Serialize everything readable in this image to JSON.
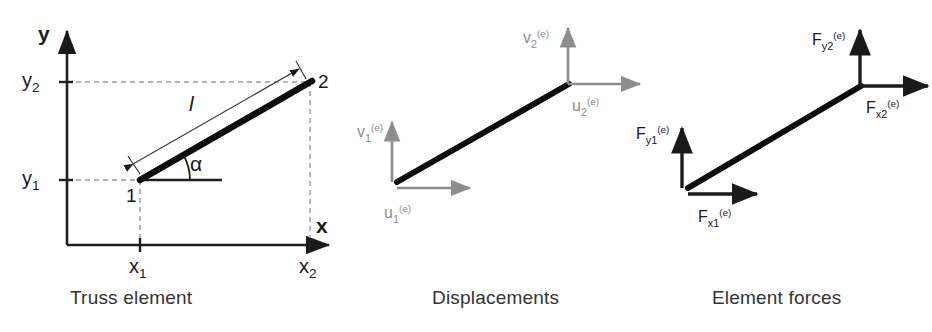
{
  "figure": {
    "panels": [
      {
        "id": "truss-element",
        "caption": "Truss element",
        "axis_x_label": "x",
        "axis_y_label": "y",
        "coords": {
          "x1": "x",
          "x1_sub": "1",
          "x2": "x",
          "x2_sub": "2",
          "y1": "y",
          "y1_sub": "1",
          "y2": "y",
          "y2_sub": "2"
        },
        "node1_label": "1",
        "node2_label": "2",
        "length_label": "l",
        "angle_label": "α"
      },
      {
        "id": "displacements",
        "caption": "Displacements",
        "vectors": [
          {
            "name": "u1",
            "base": "u",
            "sub": "1",
            "sup": "(e)",
            "direction": "right",
            "at_node": 1
          },
          {
            "name": "v1",
            "base": "v",
            "sub": "1",
            "sup": "(e)",
            "direction": "up",
            "at_node": 1
          },
          {
            "name": "u2",
            "base": "u",
            "sub": "2",
            "sup": "(e)",
            "direction": "right",
            "at_node": 2
          },
          {
            "name": "v2",
            "base": "v",
            "sub": "2",
            "sup": "(e)",
            "direction": "up",
            "at_node": 2
          }
        ]
      },
      {
        "id": "element-forces",
        "caption": "Element forces",
        "vectors": [
          {
            "name": "Fx1",
            "base": "F",
            "sub": "x1",
            "sup": "(e)",
            "direction": "right",
            "at_node": 1
          },
          {
            "name": "Fy1",
            "base": "F",
            "sub": "y1",
            "sup": "(e)",
            "direction": "up",
            "at_node": 1
          },
          {
            "name": "Fx2",
            "base": "F",
            "sub": "x2",
            "sup": "(e)",
            "direction": "right",
            "at_node": 2
          },
          {
            "name": "Fy2",
            "base": "F",
            "sub": "y2",
            "sup": "(e)",
            "direction": "up",
            "at_node": 2
          }
        ]
      }
    ],
    "colors": {
      "element": "#0d0d0d",
      "axis": "#1f1f1f",
      "dashed_projection": "#9a9a9a",
      "displacement_arrow": "#8d8d8d",
      "force_arrow": "#1a1a1a",
      "caption_text": "#333333",
      "background": "#ffffff"
    },
    "geometry": {
      "panel1": {
        "origin": [
          67,
          245
        ],
        "node1": [
          140,
          180
        ],
        "node2": [
          310,
          82
        ],
        "x_axis_end": [
          333,
          245
        ],
        "y_axis_top": [
          67,
          25
        ]
      },
      "panel2": {
        "node1": [
          397,
          182
        ],
        "node2": [
          568,
          84
        ]
      },
      "panel3": {
        "node1": [
          688,
          188
        ],
        "node2": [
          860,
          86
        ]
      }
    }
  }
}
